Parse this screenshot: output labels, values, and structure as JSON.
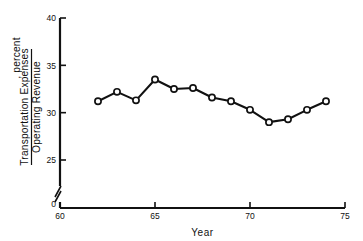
{
  "chart_data": {
    "type": "line",
    "title": "",
    "subtitle": "",
    "xlabel": "Year",
    "ylabel_numerator": "Transportation Expenses",
    "ylabel_denominator": "Operating Revenue",
    "ylabel_suffix": ", percent",
    "x": [
      62,
      63,
      64,
      65,
      66,
      67,
      68,
      69,
      70,
      71,
      72,
      73,
      74
    ],
    "values": [
      31.2,
      32.2,
      31.3,
      33.5,
      32.5,
      32.6,
      31.6,
      31.2,
      30.3,
      29.0,
      29.3,
      30.3,
      31.2
    ],
    "series": [
      {
        "name": "Transportation Expenses / Operating Revenue",
        "values": [
          31.2,
          32.2,
          31.3,
          33.5,
          32.5,
          32.6,
          31.6,
          31.2,
          30.3,
          29.0,
          29.3,
          30.3,
          31.2
        ]
      }
    ],
    "xlim": [
      60,
      75
    ],
    "ylim": [
      25,
      40
    ],
    "y_axis_break": true,
    "y_break_below": 25,
    "y_zero_label": "0",
    "xticks": [
      60,
      65,
      70,
      75
    ],
    "xtick_labels": [
      "60",
      "65",
      "70",
      "75"
    ],
    "yticks": [
      25,
      30,
      35,
      40
    ],
    "ytick_labels": [
      "25",
      "30",
      "35",
      "40"
    ],
    "grid": false,
    "legend": "none",
    "marker": "open-circle",
    "line_color": "#111111",
    "marker_fill": "#ffffff",
    "background": "#ffffff"
  }
}
